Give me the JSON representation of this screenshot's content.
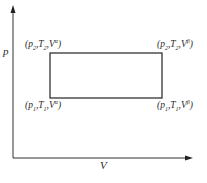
{
  "diagram": {
    "type": "p-V diagram (rectangular cycle)",
    "axes": {
      "y_label": "p",
      "x_label": "V"
    },
    "corners": [
      {
        "position": "top-left",
        "p": "p2",
        "T": "T2",
        "V": "Vα",
        "p_sym": "p",
        "p_sub": "2",
        "T_sym": "T",
        "T_sub": "2",
        "V_sym": "V",
        "V_sup": "α"
      },
      {
        "position": "top-right",
        "p": "p2",
        "T": "T2",
        "V": "Vβ",
        "p_sym": "p",
        "p_sub": "2",
        "T_sym": "T",
        "T_sub": "2",
        "V_sym": "V",
        "V_sup": "β"
      },
      {
        "position": "bottom-left",
        "p": "p1",
        "T": "T1",
        "V": "Vα",
        "p_sym": "p",
        "p_sub": "1",
        "T_sym": "T",
        "T_sub": "1",
        "V_sym": "V",
        "V_sup": "α"
      },
      {
        "position": "bottom-right",
        "p": "p1",
        "T": "T1",
        "V": "Vβ",
        "p_sym": "p",
        "p_sub": "1",
        "T_sym": "T",
        "T_sub": "1",
        "V_sym": "V",
        "V_sup": "β"
      }
    ],
    "colors": {
      "line": "#333333",
      "background": "#ffffff"
    }
  }
}
